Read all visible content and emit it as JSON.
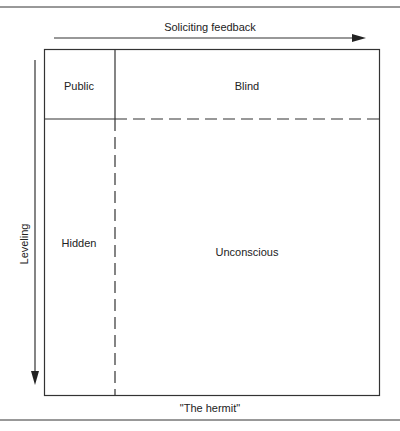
{
  "header_fragment": "URE 5.5",
  "axes": {
    "top_arrow_label": "Soliciting feedback",
    "left_arrow_label": "Leveling"
  },
  "quadrants": {
    "public": "Public",
    "blind": "Blind",
    "hidden": "Hidden",
    "unconscious": "Unconscious"
  },
  "caption": "\"The hermit\""
}
